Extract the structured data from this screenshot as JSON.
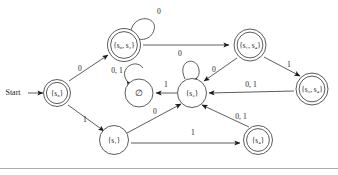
{
  "figure": {
    "type": "finite-automaton-state-diagram",
    "start_label": "Start",
    "empty_set_symbol": "∅"
  },
  "states": [
    {
      "id": "s0",
      "label": "{s₀}",
      "set_text": "{s",
      "subscript": "0",
      "set_close": "}",
      "x": 57,
      "y": 93,
      "accepting": true,
      "start": true
    },
    {
      "id": "s0s2",
      "label": "{s₀, s₂}",
      "x": 124,
      "y": 45,
      "accepting": true,
      "start": false
    },
    {
      "id": "empty",
      "label": "∅",
      "x": 139,
      "y": 93,
      "accepting": false,
      "start": false
    },
    {
      "id": "s3",
      "label": "{s₃}",
      "x": 192,
      "y": 93,
      "accepting": false,
      "start": false
    },
    {
      "id": "s1s4",
      "label": "{s₁, s₄}",
      "x": 250,
      "y": 45,
      "accepting": true,
      "start": false
    },
    {
      "id": "s3s4",
      "label": "{s₃, s₄}",
      "x": 312,
      "y": 89,
      "accepting": true,
      "start": false
    },
    {
      "id": "s1",
      "label": "{s₁}",
      "x": 114,
      "y": 140,
      "accepting": false,
      "start": false
    },
    {
      "id": "s4",
      "label": "{s₄}",
      "x": 258,
      "y": 140,
      "accepting": true,
      "start": false
    }
  ],
  "transitions": [
    {
      "from": "s0",
      "to": "s0s2",
      "label": "0",
      "label_x": 80,
      "label_y": 69
    },
    {
      "from": "s0",
      "to": "s1",
      "label": "1",
      "label_x": 85,
      "label_y": 120
    },
    {
      "from": "s0s2",
      "to": "s0s2",
      "label": "0",
      "label_x": 155,
      "label_y": 13
    },
    {
      "from": "s0s2",
      "to": "s1s4",
      "label": "",
      "label_x": 187,
      "label_y": 36
    },
    {
      "from": "s1s4",
      "to": "s3",
      "label": "0",
      "label_x": 214,
      "label_y": 70
    },
    {
      "from": "s1s4",
      "to": "s3s4",
      "label": "1",
      "label_x": 288,
      "label_y": 66
    },
    {
      "from": "empty",
      "to": "empty",
      "label": "0, 1",
      "label_x": 117,
      "label_y": 72
    },
    {
      "from": "s3",
      "to": "empty",
      "label": "1",
      "label_x": 166,
      "label_y": 85
    },
    {
      "from": "s3",
      "to": "s3",
      "label": "0",
      "label_x": 180,
      "label_y": 55
    },
    {
      "from": "s3s4",
      "to": "s3",
      "label": "0, 1",
      "label_x": 251,
      "label_y": 86
    },
    {
      "from": "s1",
      "to": "s3",
      "label": "0",
      "label_x": 155,
      "label_y": 113
    },
    {
      "from": "s1",
      "to": "s4",
      "label": "1",
      "label_x": 193,
      "label_y": 133
    },
    {
      "from": "s4",
      "to": "s3",
      "label": "0, 1",
      "label_x": 240,
      "label_y": 118
    }
  ]
}
